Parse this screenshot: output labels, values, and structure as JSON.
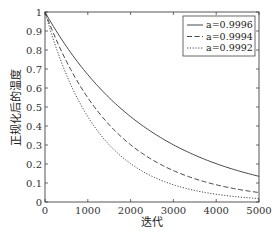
{
  "chart_data": {
    "type": "line",
    "title": "",
    "xlabel": "迭代",
    "ylabel": "正规化后的温度",
    "xlim": [
      0,
      5000
    ],
    "ylim": [
      0,
      1
    ],
    "xticks": [
      0,
      1000,
      2000,
      3000,
      4000,
      5000
    ],
    "yticks": [
      0,
      0.1,
      0.2,
      0.3,
      0.4,
      0.5,
      0.6,
      0.7,
      0.8,
      0.9,
      1
    ],
    "grid": false,
    "legend_position": "upper right",
    "x": [
      0,
      500,
      1000,
      1500,
      2000,
      2500,
      3000,
      3500,
      4000,
      4500,
      5000
    ],
    "series": [
      {
        "name": "a=0.9996",
        "style": "solid",
        "base": 0.9996,
        "values": [
          1.0,
          0.819,
          0.67,
          0.549,
          0.449,
          0.368,
          0.301,
          0.247,
          0.202,
          0.165,
          0.135
        ]
      },
      {
        "name": "a=0.9994",
        "style": "dashed",
        "base": 0.9994,
        "values": [
          1.0,
          0.741,
          0.549,
          0.407,
          0.301,
          0.223,
          0.165,
          0.122,
          0.091,
          0.067,
          0.05
        ]
      },
      {
        "name": "a=0.9992",
        "style": "dotted",
        "base": 0.9992,
        "values": [
          1.0,
          0.67,
          0.449,
          0.301,
          0.202,
          0.135,
          0.091,
          0.061,
          0.041,
          0.027,
          0.018
        ]
      }
    ]
  }
}
